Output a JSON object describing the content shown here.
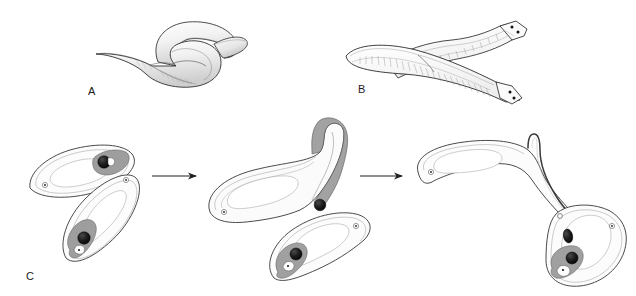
{
  "figure": {
    "kind": "scientific-line-illustration",
    "background_color": "#ffffff",
    "ink_color": "#1a1a1a",
    "width": 636,
    "height": 296
  },
  "panels": [
    {
      "id": "A",
      "label": "A",
      "description": "Two elongate worms coiled in an S-shaped mating embrace, ventral surfaces pressed together",
      "organism_count": 2,
      "shading": "soft grey gradient with fine hatching"
    },
    {
      "id": "B",
      "label": "B",
      "description": "Two flattened ribbon-like worms crossed over one another, branched ladder-like gut visible, paired dark eyespots at each flared head tip",
      "organism_count": 2,
      "shading": "stippled internal gut texture"
    },
    {
      "id": "C",
      "label": "C",
      "description": "Three-stage sequence of hypodermic insemination",
      "organism_count": 2,
      "stages": [
        {
          "index": 1,
          "caption": "Two worms approach, copulatory bulbs charged with sperm"
        },
        {
          "index": 2,
          "caption": "Donor everts its penis stylet toward the partner body wall"
        },
        {
          "index": 3,
          "caption": "Stylet pierces the partner and injects sperm hypodermically"
        }
      ],
      "arrows": [
        {
          "index": 1,
          "direction": "right"
        },
        {
          "index": 2,
          "direction": "right"
        }
      ]
    }
  ],
  "anatomy_markers": {
    "eyespot": "small circle with central dot",
    "copulatory_bulb": "dark stippled sphere",
    "seminal_vesicle": "mid-grey lobed mass",
    "stylet": "thin hairpin tube",
    "gut": "pale outlined central cavity"
  },
  "palette": {
    "outline": "#2b2b2b",
    "fill_light": "#f7f7f7",
    "fill_mid": "#d6d6d6",
    "fill_dark": "#8f8f8f",
    "organ_dark": "#151515",
    "arrow": "#222222"
  }
}
